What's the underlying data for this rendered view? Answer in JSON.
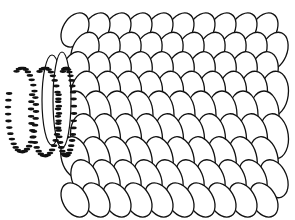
{
  "illustration": {
    "subject": "line-art-petal-cylinder-with-beaded-coils",
    "colors": {
      "background": "#ffffff",
      "stroke": "#111111",
      "fill": "#ffffff",
      "bead": "#111111"
    },
    "petal_grid": {
      "rows": 9,
      "cols": 10
    },
    "coils": 3
  }
}
